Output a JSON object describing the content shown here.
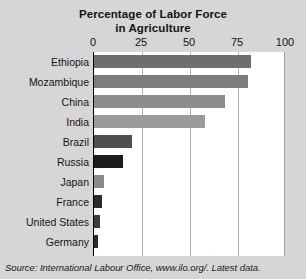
{
  "chart_data": {
    "type": "bar",
    "orientation": "horizontal",
    "title": "Percentage of Labor Force in Agriculture",
    "title_lines": [
      "Percentage of Labor Force",
      "in Agriculture"
    ],
    "categories": [
      "Ethiopia",
      "Mozambique",
      "China",
      "India",
      "Brazil",
      "Russia",
      "Japan",
      "France",
      "United States",
      "Germany"
    ],
    "values": [
      82,
      80,
      68,
      58,
      20,
      15,
      5,
      4,
      3,
      2
    ],
    "xlabel": "",
    "ylabel": "",
    "xlim": [
      0,
      100
    ],
    "xticks": [
      0,
      25,
      50,
      75,
      100
    ],
    "xtick_labels": [
      "0",
      "25",
      "50",
      "75",
      "100"
    ],
    "grid": true,
    "legend": false,
    "bar_colors": [
      "#6e6e6e",
      "#7d7d7d",
      "#8c8c8c",
      "#9b9b9b",
      "#4f4f4f",
      "#1c1c1c",
      "#8a8a8a",
      "#2b2b2b",
      "#3d3d3d",
      "#2b2b2b"
    ],
    "source": "Source: International Labour Office, www.ilo.org/. Latest data.",
    "plot_background": "#ffffff",
    "page_background": "#d6d6d6",
    "gridline_color": "#b0b0b0",
    "axis_color": "#000000"
  }
}
